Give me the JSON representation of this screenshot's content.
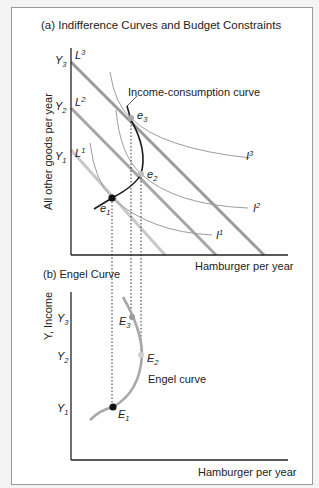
{
  "panel_a": {
    "title": "(a) Indifference Curves and Budget Constraints",
    "y_axis_label": "All other goods per year",
    "x_axis_label": "Hamburger per year",
    "y_ticks": [
      {
        "base": "Y",
        "sub": "3"
      },
      {
        "base": "Y",
        "sub": "2"
      },
      {
        "base": "Y",
        "sub": "1"
      }
    ],
    "budget_lines": [
      {
        "base": "L",
        "sup": "3"
      },
      {
        "base": "L",
        "sup": "2"
      },
      {
        "base": "L",
        "sup": "1"
      }
    ],
    "indifference_curves": [
      {
        "base": "I",
        "sup": "3"
      },
      {
        "base": "I",
        "sup": "2"
      },
      {
        "base": "I",
        "sup": "1"
      }
    ],
    "equilibria": [
      {
        "base": "e",
        "sub": "1"
      },
      {
        "base": "e",
        "sub": "2"
      },
      {
        "base": "e",
        "sub": "3"
      }
    ],
    "curve_label": "Income-consumption curve"
  },
  "panel_b": {
    "title": "(b) Engel Curve",
    "y_axis_label": "Y, Income",
    "x_axis_label": "Hamburger per year",
    "y_ticks": [
      {
        "base": "Y",
        "sub": "3"
      },
      {
        "base": "Y",
        "sub": "2"
      },
      {
        "base": "Y",
        "sub": "1"
      }
    ],
    "points": [
      {
        "base": "E",
        "sub": "1"
      },
      {
        "base": "E",
        "sub": "2"
      },
      {
        "base": "E",
        "sub": "3"
      }
    ],
    "curve_label": "Engel curve"
  },
  "colors": {
    "axis": "#222222",
    "budget_line_dark": "#9a9a9a",
    "budget_line_light": "#c4c4c4",
    "indifference": "#9c9c9c",
    "icc": "#1a1a1a",
    "engel": "#a8a8a8",
    "point_dark": "#111111",
    "point_gray": "#a0a0a0"
  }
}
